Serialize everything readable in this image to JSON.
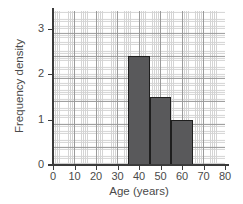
{
  "chart_data": {
    "type": "bar",
    "title": "",
    "xlabel": "Age (years)",
    "ylabel": "Frequency density",
    "xlim": [
      0,
      80
    ],
    "ylim": [
      0,
      3.4
    ],
    "xticks": [
      0,
      10,
      20,
      30,
      40,
      50,
      60,
      70,
      80
    ],
    "xtick_labels": [
      "0",
      "10",
      "20",
      "30",
      "40",
      "50",
      "60",
      "70",
      "80"
    ],
    "yticks": [
      0,
      1,
      2,
      3
    ],
    "ytick_labels": [
      "0",
      "1",
      "2",
      "3"
    ],
    "grid": true,
    "grid_major_x_step": 10,
    "grid_minor_x_step": 1,
    "grid_major_y_step": 0.5,
    "grid_minor_y_step": 0.05,
    "legend": false,
    "bar_color": "#59595b",
    "bar_edge_color": "#1e1e1e",
    "grid_major_color": "#9a9a9a",
    "grid_minor_color": "#d4d4d4",
    "axis_color": "#3b3b3b",
    "bins": [
      {
        "label": "35-45",
        "x_start": 35,
        "x_end": 45,
        "value": 2.4
      },
      {
        "label": "45-55",
        "x_start": 45,
        "x_end": 55,
        "value": 1.5
      },
      {
        "label": "55-65",
        "x_start": 55,
        "x_end": 65,
        "value": 1.0
      }
    ],
    "categories": [
      "35-45",
      "45-55",
      "55-65"
    ],
    "values": [
      2.4,
      1.5,
      1.0
    ]
  }
}
